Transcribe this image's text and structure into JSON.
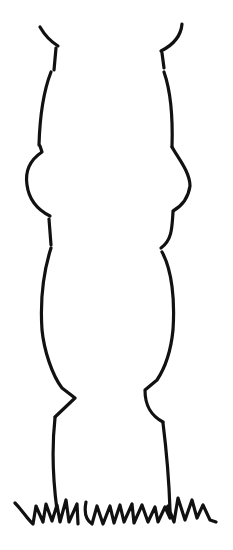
{
  "image": {
    "subject": "line drawing of a leg / column outline standing on grass",
    "background_color": "#ffffff",
    "line_color": "#111111",
    "line_width": 3.2
  }
}
